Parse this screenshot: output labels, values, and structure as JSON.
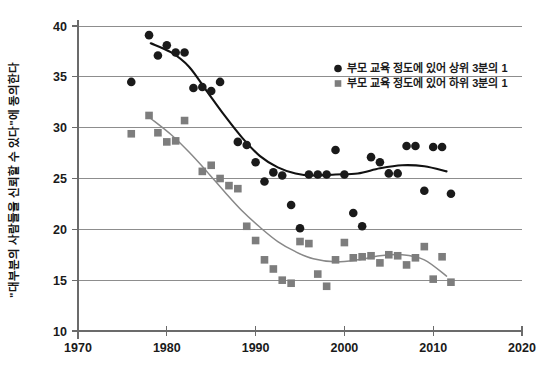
{
  "chart_data": {
    "type": "scatter",
    "title": "",
    "xlabel": "",
    "ylabel": "\"대부분의 사람들을 신뢰할 수 있다\"에 동의한다",
    "xlim": [
      1970,
      2020
    ],
    "ylim": [
      10,
      40
    ],
    "xticks": [
      1970,
      1980,
      1990,
      2000,
      2010,
      2020
    ],
    "yticks": [
      10,
      15,
      20,
      25,
      30,
      35,
      40
    ],
    "grid": "horizontal",
    "legend_position": "top-right",
    "colors": {
      "top_third": "#1a1a1a",
      "bottom_third": "#7d7d7d",
      "gridline": "#8d8d8d",
      "background": "#ffffff"
    },
    "series": [
      {
        "name": "부모 교육 정도에 있어 상위 3분의 1",
        "marker": "circle",
        "color": "#1a1a1a",
        "points": [
          [
            1976,
            34.5
          ],
          [
            1978,
            39.1
          ],
          [
            1979,
            37.1
          ],
          [
            1980,
            38.1
          ],
          [
            1981,
            37.4
          ],
          [
            1982,
            37.4
          ],
          [
            1983,
            33.9
          ],
          [
            1984,
            34.0
          ],
          [
            1985,
            33.6
          ],
          [
            1986,
            34.5
          ],
          [
            1988,
            28.6
          ],
          [
            1989,
            28.3
          ],
          [
            1990,
            26.6
          ],
          [
            1991,
            24.7
          ],
          [
            1992,
            25.6
          ],
          [
            1993,
            25.3
          ],
          [
            1994,
            22.4
          ],
          [
            1995,
            20.1
          ],
          [
            1996,
            25.4
          ],
          [
            1997,
            25.4
          ],
          [
            1998,
            25.4
          ],
          [
            1999,
            27.8
          ],
          [
            2000,
            25.4
          ],
          [
            2001,
            21.6
          ],
          [
            2002,
            20.3
          ],
          [
            2003,
            27.1
          ],
          [
            2004,
            26.6
          ],
          [
            2005,
            25.5
          ],
          [
            2006,
            25.5
          ],
          [
            2007,
            28.2
          ],
          [
            2008,
            28.2
          ],
          [
            2009,
            23.8
          ],
          [
            2010,
            28.1
          ],
          [
            2011,
            28.1
          ],
          [
            2012,
            23.5
          ]
        ]
      },
      {
        "name": "부모 교육 정도에 있어 하위 3분의 1",
        "marker": "square",
        "color": "#7d7d7d",
        "points": [
          [
            1976,
            29.4
          ],
          [
            1978,
            31.2
          ],
          [
            1979,
            29.5
          ],
          [
            1980,
            28.6
          ],
          [
            1981,
            28.7
          ],
          [
            1982,
            30.7
          ],
          [
            1984,
            25.7
          ],
          [
            1985,
            26.3
          ],
          [
            1986,
            25.0
          ],
          [
            1987,
            24.3
          ],
          [
            1988,
            24.0
          ],
          [
            1989,
            20.3
          ],
          [
            1990,
            18.9
          ],
          [
            1991,
            17.0
          ],
          [
            1992,
            16.1
          ],
          [
            1993,
            15.0
          ],
          [
            1994,
            14.7
          ],
          [
            1995,
            18.8
          ],
          [
            1996,
            18.6
          ],
          [
            1997,
            15.6
          ],
          [
            1998,
            14.4
          ],
          [
            1999,
            17.0
          ],
          [
            2000,
            18.7
          ],
          [
            2001,
            17.2
          ],
          [
            2002,
            17.3
          ],
          [
            2003,
            17.4
          ],
          [
            2004,
            16.7
          ],
          [
            2005,
            17.5
          ],
          [
            2006,
            17.4
          ],
          [
            2007,
            16.5
          ],
          [
            2008,
            17.2
          ],
          [
            2009,
            18.3
          ],
          [
            2010,
            15.1
          ],
          [
            2011,
            17.3
          ],
          [
            2012,
            14.8
          ]
        ]
      }
    ],
    "trend_curves": [
      {
        "name": "부모 교육 정도에 있어 상위 3분의 1",
        "color": "#111111",
        "path": [
          [
            1978.2,
            38.3
          ],
          [
            1980.5,
            37.4
          ],
          [
            1982.5,
            36.0
          ],
          [
            1984.5,
            33.6
          ],
          [
            1986.5,
            31.2
          ],
          [
            1988.5,
            29.0
          ],
          [
            1990.5,
            27.2
          ],
          [
            1992.5,
            26.1
          ],
          [
            1994.5,
            25.5
          ],
          [
            1996.5,
            25.3
          ],
          [
            1999.0,
            25.4
          ],
          [
            2001.5,
            25.5
          ],
          [
            2004.0,
            26.0
          ],
          [
            2006.5,
            26.3
          ],
          [
            2009.0,
            26.2
          ],
          [
            2011.5,
            25.7
          ]
        ]
      },
      {
        "name": "부모 교육 정도에 있어 하위 3분의 1",
        "color": "#888888",
        "path": [
          [
            1978.2,
            30.9
          ],
          [
            1980.5,
            29.3
          ],
          [
            1982.5,
            27.6
          ],
          [
            1984.5,
            25.7
          ],
          [
            1986.5,
            23.7
          ],
          [
            1988.5,
            21.8
          ],
          [
            1990.5,
            20.2
          ],
          [
            1992.5,
            18.8
          ],
          [
            1994.5,
            17.8
          ],
          [
            1996.5,
            17.1
          ],
          [
            1999.0,
            16.8
          ],
          [
            2001.5,
            17.0
          ],
          [
            2004.0,
            17.4
          ],
          [
            2006.5,
            17.5
          ],
          [
            2009.0,
            17.0
          ],
          [
            2011.5,
            15.4
          ]
        ]
      }
    ]
  },
  "axis": {
    "y_title": "\"대부분의 사람들을 신뢰할 수 있다\"에 동의한다",
    "x_tick_labels": [
      "1970",
      "1980",
      "1990",
      "2000",
      "2010",
      "2020"
    ],
    "y_tick_labels": [
      "40",
      "35",
      "30",
      "25",
      "20",
      "15",
      "10"
    ]
  },
  "legend": {
    "items": [
      {
        "label": "부모 교육 정도에 있어 상위 3분의 1",
        "marker": "circle-marker",
        "color": "#1a1a1a"
      },
      {
        "label": "부모 교육 정도에 있어 하위 3분의 1",
        "marker": "square-marker",
        "color": "#7d7d7d"
      }
    ]
  }
}
